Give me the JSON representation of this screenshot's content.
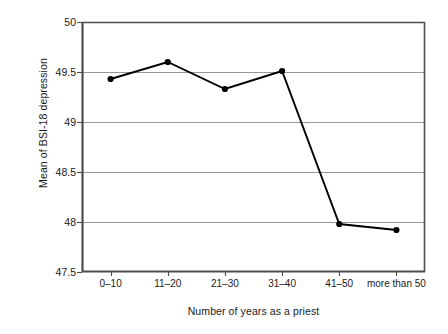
{
  "chart_data": {
    "type": "line",
    "title": "",
    "xlabel": "Number of years as a priest",
    "ylabel": "Mean of BSI-18 depression",
    "categories": [
      "0–10",
      "11–20",
      "21–30",
      "31–40",
      "41–50",
      "more than 50"
    ],
    "values": [
      49.43,
      49.6,
      49.33,
      49.51,
      47.98,
      47.92
    ],
    "series": [
      {
        "name": "Mean of BSI-18 depression",
        "values": [
          49.43,
          49.6,
          49.33,
          49.51,
          47.98,
          47.92
        ]
      }
    ],
    "ylim": [
      47.5,
      50.0
    ],
    "ytick_labels": [
      "50",
      "49.5",
      "49",
      "48.5",
      "48",
      "47.5"
    ],
    "ytick_values": [
      50,
      49.5,
      49,
      48.5,
      48,
      47.5
    ],
    "grid": "horizontal",
    "legend": "none",
    "line_color": "#000000",
    "marker_color": "#000000",
    "grid_color": "#8c8c8c",
    "frame_color": "#4d4d4d",
    "background_color": "#ffffff"
  }
}
